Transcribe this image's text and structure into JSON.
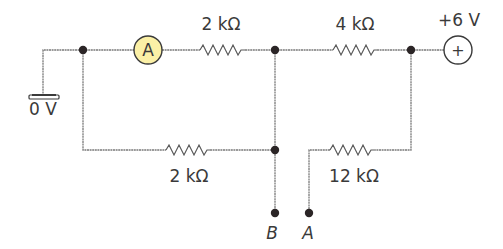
{
  "diagram": {
    "type": "circuit",
    "components": {
      "ammeter": {
        "symbol": "A",
        "color": "#fbf0a6"
      },
      "supply": {
        "label": "+6 V",
        "symbol": "+"
      },
      "ground": {
        "label": "0 V"
      },
      "resistor_top_left": {
        "label": "2 kΩ"
      },
      "resistor_top_right": {
        "label": "4 kΩ"
      },
      "resistor_bottom_left": {
        "label": "2 kΩ"
      },
      "resistor_bottom_right": {
        "label": "12 kΩ"
      }
    },
    "terminals": {
      "B": {
        "label": "B"
      },
      "A": {
        "label": "A"
      }
    }
  }
}
